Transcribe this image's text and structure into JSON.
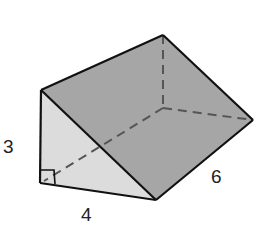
{
  "figure": {
    "type": "triangular-prism",
    "labels": {
      "height": "3",
      "base": "4",
      "length": "6"
    },
    "colors": {
      "slanted_face": "#a6a6a6",
      "right_face": "#9d9d9d",
      "front_face": "#dcdcdc",
      "edge": "#111111",
      "hidden_edge": "#555555"
    }
  }
}
